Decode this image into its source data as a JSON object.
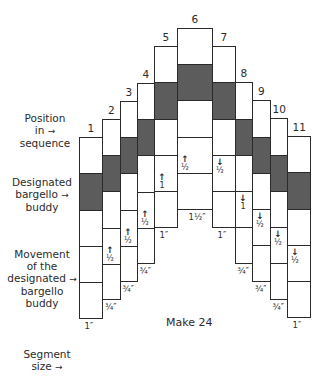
{
  "labels": {
    "position": [
      "Position",
      "in",
      "sequence"
    ],
    "buddy": [
      "Designated",
      "bargello",
      "buddy"
    ],
    "movement": [
      "Movement",
      "of the",
      "designated",
      "bargello",
      "buddy"
    ],
    "segment_size": [
      "Segment",
      "size"
    ],
    "arrow": "→"
  },
  "make_text": "Make 24",
  "colors": {
    "dark_segment": "#5c5c5c",
    "outline": "#2a2a2a"
  },
  "columns": [
    {
      "num": "1",
      "x": 79,
      "w": 23,
      "lines": [
        137,
        173,
        210,
        246,
        282,
        318
      ],
      "dark": [
        1
      ],
      "movement": "",
      "dir": "",
      "size": "1″"
    },
    {
      "num": "2",
      "x": 102,
      "w": 18,
      "lines": [
        119,
        155,
        191,
        228,
        264,
        299
      ],
      "dark": [
        1
      ],
      "movement": "½",
      "dir": "up",
      "size": "¾″"
    },
    {
      "num": "3",
      "x": 120,
      "w": 17,
      "lines": [
        101,
        137,
        173,
        210,
        246,
        281
      ],
      "dark": [
        1
      ],
      "movement": "½",
      "dir": "up",
      "size": "¾″"
    },
    {
      "num": "4",
      "x": 137,
      "w": 17,
      "lines": [
        83,
        119,
        155,
        192,
        228,
        263
      ],
      "dark": [
        1
      ],
      "movement": "½",
      "dir": "up",
      "size": "¾″"
    },
    {
      "num": "5",
      "x": 154,
      "w": 23,
      "lines": [
        46,
        82,
        119,
        155,
        191,
        227
      ],
      "dark": [
        1
      ],
      "movement": "1",
      "dir": "up",
      "size": "1″"
    },
    {
      "num": "6",
      "x": 177,
      "w": 35,
      "lines": [
        28,
        64,
        100,
        137,
        173,
        209
      ],
      "dark": [
        1
      ],
      "movement": "½",
      "dir": "up",
      "size": "1½″"
    },
    {
      "num": "7",
      "x": 212,
      "w": 23,
      "lines": [
        46,
        82,
        119,
        155,
        191,
        227
      ],
      "dark": [
        1
      ],
      "movement": "½",
      "dir": "down",
      "size": "1″"
    },
    {
      "num": "8",
      "x": 235,
      "w": 17,
      "lines": [
        82,
        119,
        155,
        191,
        227,
        263
      ],
      "dark": [
        1
      ],
      "movement": "1",
      "dir": "down",
      "size": "¾″"
    },
    {
      "num": "9",
      "x": 252,
      "w": 18,
      "lines": [
        100,
        137,
        173,
        209,
        245,
        281
      ],
      "dark": [
        1
      ],
      "movement": "½",
      "dir": "down",
      "size": "¾″"
    },
    {
      "num": "10",
      "x": 270,
      "w": 17,
      "lines": [
        118,
        155,
        191,
        227,
        263,
        299
      ],
      "dark": [
        1
      ],
      "movement": "½",
      "dir": "down",
      "size": "¾″"
    },
    {
      "num": "11",
      "x": 287,
      "w": 23,
      "lines": [
        136,
        172,
        209,
        245,
        281,
        317
      ],
      "dark": [
        1
      ],
      "movement": "½",
      "dir": "down",
      "size": "1″"
    }
  ]
}
